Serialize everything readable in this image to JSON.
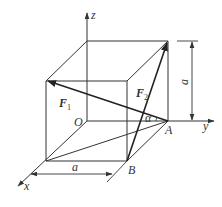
{
  "diagram": {
    "colors": {
      "line": "#333333",
      "background": "#ffffff"
    },
    "axes": {
      "x": {
        "label": "x"
      },
      "y": {
        "label": "y"
      },
      "z": {
        "label": "z"
      }
    },
    "points": {
      "origin": "O",
      "A": "A",
      "B": "B"
    },
    "forces": [
      {
        "symbol": "F",
        "subscript": "1"
      },
      {
        "symbol": "F",
        "subscript": "2"
      }
    ],
    "angle_label": "α",
    "dimensions": {
      "horizontal": "a",
      "vertical": "a"
    }
  }
}
